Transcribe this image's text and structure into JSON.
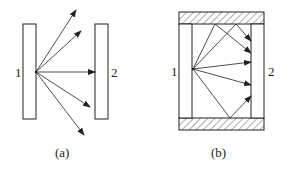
{
  "figures": [
    {
      "id": "a",
      "caption": "(a)",
      "plate_labels": [
        "1",
        "2"
      ],
      "description": "Radiation from a point on plate 1 spreading in many directions; only some rays reach plate 2"
    },
    {
      "id": "b",
      "caption": "(b)",
      "plate_labels": [
        "1",
        "2"
      ],
      "description": "Plates 1 and 2 enclosed by reflecting walls (hatched) top and bottom; rays reflect off walls and reach plate 2"
    }
  ],
  "colors": {
    "line": "#222222",
    "background": "#ffffff"
  }
}
